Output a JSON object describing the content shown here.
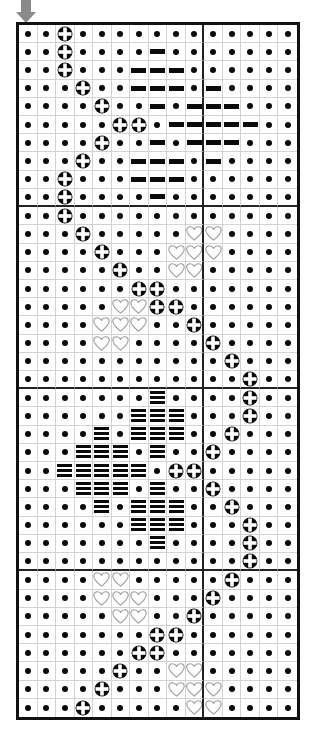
{
  "document": {
    "kind": "cross-stitch-pattern-chart",
    "title": "",
    "background_color": "#ffffff",
    "frame_color": "#111111",
    "grid_line_color": "#d2d2d2",
    "heavy_line_color": "#222222",
    "symbol_color": "#0a0a0a",
    "heart_outline_color": "#9a9a9a"
  },
  "marker": {
    "name": "center-column-arrow",
    "glyph": "down-arrow",
    "color": "#808080",
    "points_to_column": 1
  },
  "chart_data": {
    "type": "heatmap",
    "title": "",
    "xlabel": "",
    "ylabel": "",
    "columns": 15,
    "rows": 38,
    "heavy_grid_every_columns": 10,
    "heavy_grid_every_rows": 10,
    "legend": [
      {
        "key": "dot",
        "symbol": "•",
        "label": "dot"
      },
      {
        "key": "cross",
        "symbol": "⊕",
        "label": "cross-in-circle"
      },
      {
        "key": "bar",
        "symbol": "▬",
        "label": "solid-bar"
      },
      {
        "key": "trip",
        "symbol": "≡",
        "label": "triple-bar"
      },
      {
        "key": "heart",
        "symbol": "♡",
        "label": "open-heart"
      }
    ],
    "cells": [
      [
        "dot",
        "dot",
        "cross",
        "dot",
        "dot",
        "dot",
        "dot",
        "dot",
        "dot",
        "dot",
        "dot",
        "dot",
        "dot",
        "dot",
        "dot"
      ],
      [
        "dot",
        "dot",
        "cross",
        "dot",
        "dot",
        "dot",
        "dot",
        "bar",
        "dot",
        "dot",
        "dot",
        "dot",
        "dot",
        "dot",
        "dot"
      ],
      [
        "dot",
        "dot",
        "cross",
        "dot",
        "dot",
        "dot",
        "bar",
        "bar",
        "bar",
        "dot",
        "dot",
        "dot",
        "dot",
        "dot",
        "dot"
      ],
      [
        "dot",
        "dot",
        "dot",
        "cross",
        "dot",
        "dot",
        "bar",
        "bar",
        "bar",
        "dot",
        "bar",
        "dot",
        "dot",
        "dot",
        "dot"
      ],
      [
        "dot",
        "dot",
        "dot",
        "dot",
        "cross",
        "dot",
        "dot",
        "bar",
        "dot",
        "bar",
        "bar",
        "bar",
        "dot",
        "dot",
        "dot"
      ],
      [
        "dot",
        "dot",
        "dot",
        "dot",
        "dot",
        "cross",
        "cross",
        "dot",
        "bar",
        "bar",
        "bar",
        "bar",
        "bar",
        "dot",
        "dot"
      ],
      [
        "dot",
        "dot",
        "dot",
        "dot",
        "cross",
        "dot",
        "dot",
        "bar",
        "dot",
        "bar",
        "bar",
        "bar",
        "dot",
        "dot",
        "dot"
      ],
      [
        "dot",
        "dot",
        "dot",
        "cross",
        "dot",
        "dot",
        "bar",
        "bar",
        "bar",
        "dot",
        "bar",
        "dot",
        "dot",
        "dot",
        "dot"
      ],
      [
        "dot",
        "dot",
        "cross",
        "dot",
        "dot",
        "dot",
        "bar",
        "bar",
        "bar",
        "dot",
        "dot",
        "dot",
        "dot",
        "dot",
        "dot"
      ],
      [
        "dot",
        "dot",
        "cross",
        "dot",
        "dot",
        "dot",
        "dot",
        "bar",
        "dot",
        "dot",
        "dot",
        "dot",
        "dot",
        "dot",
        "dot"
      ],
      [
        "dot",
        "dot",
        "cross",
        "dot",
        "dot",
        "dot",
        "dot",
        "dot",
        "dot",
        "dot",
        "dot",
        "dot",
        "dot",
        "dot",
        "dot"
      ],
      [
        "dot",
        "dot",
        "dot",
        "cross",
        "dot",
        "dot",
        "dot",
        "dot",
        "dot",
        "heart",
        "heart",
        "dot",
        "dot",
        "dot",
        "dot"
      ],
      [
        "dot",
        "dot",
        "dot",
        "dot",
        "cross",
        "dot",
        "dot",
        "dot",
        "heart",
        "heart",
        "heart",
        "dot",
        "dot",
        "dot",
        "dot"
      ],
      [
        "dot",
        "dot",
        "dot",
        "dot",
        "dot",
        "cross",
        "dot",
        "dot",
        "heart",
        "heart",
        "dot",
        "dot",
        "dot",
        "dot",
        "dot"
      ],
      [
        "dot",
        "dot",
        "dot",
        "dot",
        "dot",
        "dot",
        "cross",
        "cross",
        "dot",
        "dot",
        "dot",
        "dot",
        "dot",
        "dot",
        "dot"
      ],
      [
        "dot",
        "dot",
        "dot",
        "dot",
        "dot",
        "heart",
        "heart",
        "cross",
        "cross",
        "dot",
        "dot",
        "dot",
        "dot",
        "dot",
        "dot"
      ],
      [
        "dot",
        "dot",
        "dot",
        "dot",
        "heart",
        "heart",
        "heart",
        "dot",
        "dot",
        "cross",
        "dot",
        "dot",
        "dot",
        "dot",
        "dot"
      ],
      [
        "dot",
        "dot",
        "dot",
        "dot",
        "heart",
        "heart",
        "dot",
        "dot",
        "dot",
        "dot",
        "cross",
        "dot",
        "dot",
        "dot",
        "dot"
      ],
      [
        "dot",
        "dot",
        "dot",
        "dot",
        "dot",
        "dot",
        "dot",
        "dot",
        "dot",
        "dot",
        "dot",
        "cross",
        "dot",
        "dot",
        "dot"
      ],
      [
        "dot",
        "dot",
        "dot",
        "dot",
        "dot",
        "dot",
        "dot",
        "dot",
        "dot",
        "dot",
        "dot",
        "dot",
        "cross",
        "dot",
        "dot"
      ],
      [
        "dot",
        "dot",
        "dot",
        "dot",
        "dot",
        "dot",
        "dot",
        "trip",
        "dot",
        "dot",
        "dot",
        "dot",
        "cross",
        "dot",
        "dot"
      ],
      [
        "dot",
        "dot",
        "dot",
        "dot",
        "dot",
        "dot",
        "trip",
        "trip",
        "trip",
        "dot",
        "dot",
        "dot",
        "cross",
        "dot",
        "dot"
      ],
      [
        "dot",
        "dot",
        "dot",
        "dot",
        "trip",
        "dot",
        "trip",
        "trip",
        "trip",
        "dot",
        "dot",
        "cross",
        "dot",
        "dot",
        "dot"
      ],
      [
        "dot",
        "dot",
        "dot",
        "trip",
        "trip",
        "trip",
        "dot",
        "trip",
        "dot",
        "dot",
        "cross",
        "dot",
        "dot",
        "dot",
        "dot"
      ],
      [
        "dot",
        "dot",
        "trip",
        "trip",
        "trip",
        "trip",
        "trip",
        "dot",
        "cross",
        "cross",
        "dot",
        "dot",
        "dot",
        "dot",
        "dot"
      ],
      [
        "dot",
        "dot",
        "dot",
        "trip",
        "trip",
        "trip",
        "dot",
        "trip",
        "dot",
        "dot",
        "cross",
        "dot",
        "dot",
        "dot",
        "dot"
      ],
      [
        "dot",
        "dot",
        "dot",
        "dot",
        "trip",
        "dot",
        "trip",
        "trip",
        "trip",
        "dot",
        "dot",
        "cross",
        "dot",
        "dot",
        "dot"
      ],
      [
        "dot",
        "dot",
        "dot",
        "dot",
        "dot",
        "dot",
        "trip",
        "trip",
        "trip",
        "dot",
        "dot",
        "dot",
        "cross",
        "dot",
        "dot"
      ],
      [
        "dot",
        "dot",
        "dot",
        "dot",
        "dot",
        "dot",
        "dot",
        "trip",
        "dot",
        "dot",
        "dot",
        "dot",
        "cross",
        "dot",
        "dot"
      ],
      [
        "dot",
        "dot",
        "dot",
        "dot",
        "dot",
        "dot",
        "dot",
        "dot",
        "dot",
        "dot",
        "dot",
        "dot",
        "cross",
        "dot",
        "dot"
      ],
      [
        "dot",
        "dot",
        "dot",
        "dot",
        "heart",
        "heart",
        "dot",
        "dot",
        "dot",
        "dot",
        "dot",
        "cross",
        "dot",
        "dot",
        "dot"
      ],
      [
        "dot",
        "dot",
        "dot",
        "dot",
        "heart",
        "heart",
        "heart",
        "dot",
        "dot",
        "dot",
        "cross",
        "dot",
        "dot",
        "dot",
        "dot"
      ],
      [
        "dot",
        "dot",
        "dot",
        "dot",
        "dot",
        "heart",
        "heart",
        "dot",
        "dot",
        "cross",
        "dot",
        "dot",
        "dot",
        "dot",
        "dot"
      ],
      [
        "dot",
        "dot",
        "dot",
        "dot",
        "dot",
        "dot",
        "dot",
        "cross",
        "cross",
        "dot",
        "dot",
        "dot",
        "dot",
        "dot",
        "dot"
      ],
      [
        "dot",
        "dot",
        "dot",
        "dot",
        "dot",
        "dot",
        "cross",
        "cross",
        "dot",
        "dot",
        "dot",
        "dot",
        "dot",
        "dot",
        "dot"
      ],
      [
        "dot",
        "dot",
        "dot",
        "dot",
        "dot",
        "cross",
        "dot",
        "dot",
        "heart",
        "heart",
        "dot",
        "dot",
        "dot",
        "dot",
        "dot"
      ],
      [
        "dot",
        "dot",
        "dot",
        "dot",
        "cross",
        "dot",
        "dot",
        "dot",
        "heart",
        "heart",
        "heart",
        "dot",
        "dot",
        "dot",
        "dot"
      ],
      [
        "dot",
        "dot",
        "dot",
        "cross",
        "dot",
        "dot",
        "dot",
        "dot",
        "dot",
        "heart",
        "heart",
        "dot",
        "dot",
        "dot",
        "dot"
      ]
    ]
  }
}
